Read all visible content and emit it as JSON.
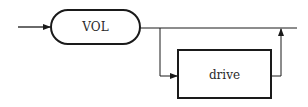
{
  "diagram": {
    "type": "syntax-railroad",
    "nodes": [
      {
        "id": "vol",
        "label": "VOL",
        "shape": "rounded-terminal"
      },
      {
        "id": "drive",
        "label": "drive",
        "shape": "rectangle-nonterminal",
        "optional": true
      }
    ],
    "colors": {
      "stroke": "#1a1a1a",
      "text": "#2a2a2a",
      "background": "#ffffff"
    }
  }
}
